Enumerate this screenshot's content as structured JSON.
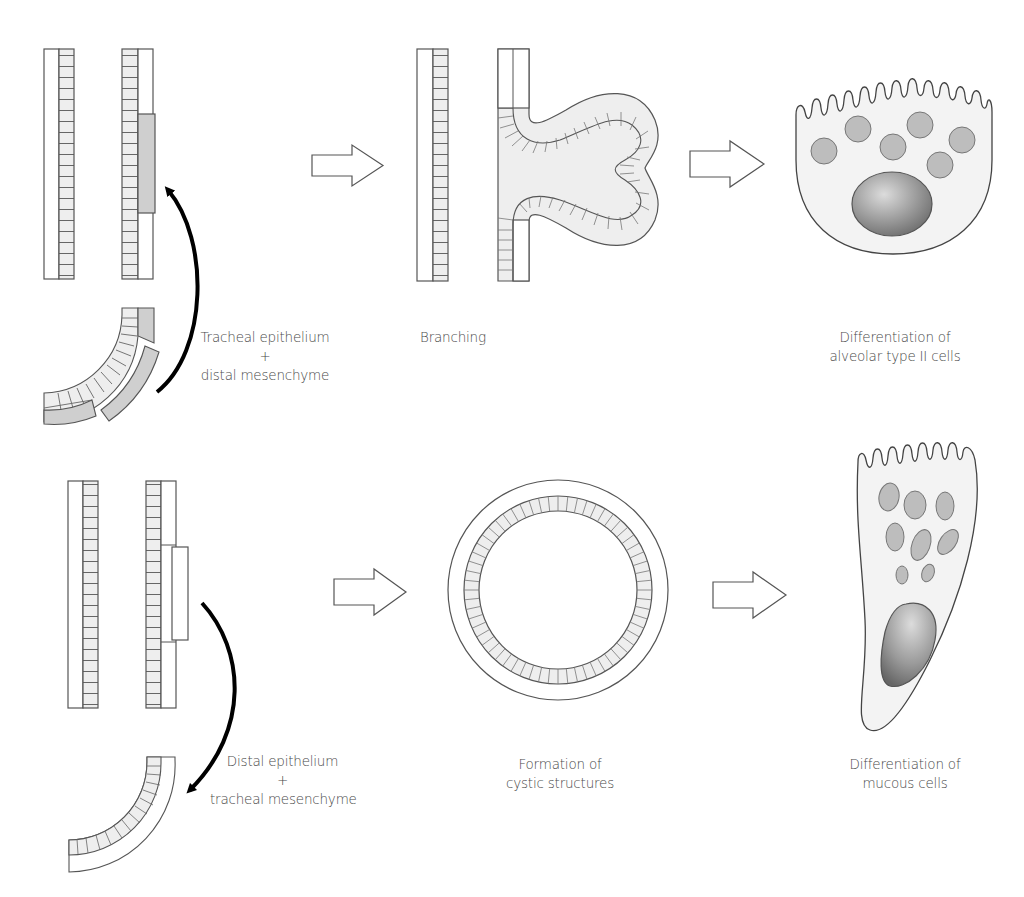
{
  "diagram": {
    "colors": {
      "stroke": "#555555",
      "epithelium_fill": "#eeeeee",
      "mesenchyme_fill": "#cfcfcf",
      "cell_fill": "#f3f3f3",
      "granule_fill": "#bdbdbd",
      "nucleus_dark": "#777777",
      "nucleus_light": "#d6d6d6",
      "arrow": "#000000"
    },
    "top_row": {
      "recombination_label": {
        "line1": "Tracheal epithelium",
        "line2": "+",
        "line3": "distal mesenchyme"
      },
      "result_label": "Branching",
      "differentiation_label": {
        "line1": "Differentiation of",
        "line2": "alveolar type II cells"
      }
    },
    "bottom_row": {
      "recombination_label": {
        "line1": "Distal epithelium",
        "line2": "+",
        "line3": "tracheal mesenchyme"
      },
      "result_label": {
        "line1": "Formation of",
        "line2": "cystic structures"
      },
      "differentiation_label": {
        "line1": "Differentiation of",
        "line2": "mucous cells"
      }
    }
  }
}
